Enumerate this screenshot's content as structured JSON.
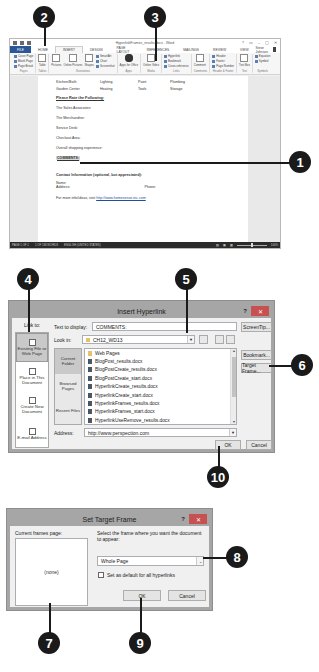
{
  "callouts": {
    "c1": "1",
    "c2": "2",
    "c3": "3",
    "c4": "4",
    "c5": "5",
    "c6": "6",
    "c7": "7",
    "c8": "8",
    "c9": "9",
    "c10": "10"
  },
  "word": {
    "title": "HyperlinkFrames_results.docx - Word",
    "window_controls": [
      "?",
      "▭",
      "–",
      "▢",
      "✕"
    ],
    "tabs": [
      "FILE",
      "HOME",
      "INSERT",
      "DESIGN",
      "PAGE LAYOUT",
      "REFERENCES",
      "MAILINGS",
      "REVIEW",
      "VIEW"
    ],
    "active_tab": "INSERT",
    "user": "Steve Johnson",
    "ribbon": {
      "pages": {
        "items": [
          "Cover Page",
          "Blank Page",
          "Page Break"
        ],
        "label": "Pages"
      },
      "tables": {
        "items": [
          "Table"
        ],
        "label": "Tables"
      },
      "illustrations": {
        "items": [
          "Pictures",
          "Online Pictures",
          "Shapes"
        ],
        "small": [
          "SmartArt",
          "Chart",
          "Screenshot"
        ],
        "label": "Illustrations"
      },
      "apps": {
        "items": [
          "Apps for Office"
        ],
        "label": "Apps"
      },
      "media": {
        "items": [
          "Online Video"
        ],
        "label": "Media"
      },
      "links": {
        "small": [
          "Hyperlink",
          "Bookmark",
          "Cross-reference"
        ],
        "label": "Links"
      },
      "comments": {
        "items": [
          "Comment"
        ],
        "label": "Comments"
      },
      "header_footer": {
        "small": [
          "Header",
          "Footer",
          "Page Number"
        ],
        "label": "Header & Footer"
      },
      "text": {
        "items": [
          "Text Box"
        ],
        "label": "Text"
      },
      "symbols": {
        "small": [
          "Equation",
          "Symbol"
        ],
        "label": "Symbols"
      }
    },
    "document": {
      "row1": [
        "Kitchen/Bath",
        "Lighting",
        "Paint",
        "Plumbing"
      ],
      "row2": [
        "Garden Center",
        "Heating",
        "Tools",
        "Storage"
      ],
      "rate_heading": "Please Rate the Following:",
      "rate_items": [
        "The Sales Associates:",
        "The Merchandise:",
        "Service Desk:",
        "Checkout Area:",
        "Overall shopping experience:"
      ],
      "comments": "COMMENTS:",
      "contact_heading": "Contact Information (optional, but appreciated):",
      "name_label": "Name:",
      "address_label": "Address:",
      "phone_label": "Phone:",
      "more_info": "For more info/ideas, visit",
      "more_info_link": "http://www.homesense.inc.com"
    },
    "status": {
      "page": "PAGE 1 OF 1",
      "words": "1 OF 138 WORDS",
      "lang": "ENGLISH (UNITED STATES)",
      "zoom": "100%"
    }
  },
  "insert_hyperlink": {
    "title": "Insert Hyperlink",
    "help": "?",
    "close": "✕",
    "link_to_label": "Link to:",
    "link_to_items": [
      "Existing File or Web Page",
      "Place in This Document",
      "Create New Document",
      "E-mail Address"
    ],
    "text_to_display_label": "Text to display:",
    "text_to_display_value": "COMMENTS:",
    "screentip": "ScreenTip...",
    "look_in_label": "Look in:",
    "look_in_value": "CH12_WD13",
    "browse_items": [
      "Current Folder",
      "Browsed Pages",
      "Recent Files"
    ],
    "files": [
      "Web Pages",
      "BlogPost_results.docx",
      "BlogPostCreate_results.docx",
      "BlogPostCreate_start.docx",
      "HyperlinkCreate_results.docx",
      "HyperlinkCreate_start.docx",
      "HyperlinkFrames_results.docx",
      "HyperlinkFrames_start.docx",
      "HyperlinkUseRemove_results.docx"
    ],
    "bookmark": "Bookmark...",
    "target_frame": "Target Frame...",
    "address_label": "Address:",
    "address_value": "http://www.perspection.com",
    "ok": "OK",
    "cancel": "Cancel"
  },
  "set_target_frame": {
    "title": "Set Target Frame",
    "help": "?",
    "close": "✕",
    "current_frames_label": "Current frames page:",
    "current_frames_value": "(none)",
    "select_label": "Select the frame where you want the document to appear:",
    "select_value": "Whole Page",
    "default_checkbox": "Set as default for all hyperlinks",
    "ok": "OK",
    "cancel": "Cancel"
  }
}
